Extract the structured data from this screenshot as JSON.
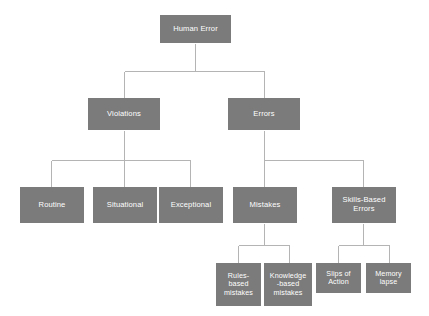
{
  "diagram": {
    "type": "tree-hierarchy",
    "background_color": "#ffffff",
    "node_fill_color": "#7b7b7b",
    "node_text_color": "#ffffff",
    "connector_color": "#b4b4b4",
    "nodes": {
      "root": {
        "label": "Human Error"
      },
      "violations": {
        "label": "Violations"
      },
      "errors": {
        "label": "Errors"
      },
      "routine": {
        "label": "Routine"
      },
      "situational": {
        "label": "Situational"
      },
      "exceptional": {
        "label": "Exceptional"
      },
      "mistakes": {
        "label": "Mistakes"
      },
      "skills_based_errors": {
        "label": "Skills-Based\nErrors"
      },
      "rules_based_mistakes": {
        "label": "Rules-\nbased\nmistakes"
      },
      "knowledge_based_mistakes": {
        "label": "Knowledge\n-based\nmistakes"
      },
      "slips_of_action": {
        "label": "Slips of\nAction"
      },
      "memory_lapse": {
        "label": "Memory\nlapse"
      }
    }
  }
}
